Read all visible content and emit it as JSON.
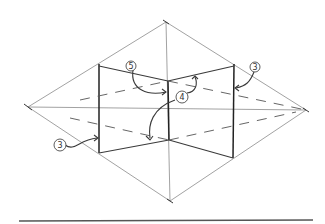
{
  "diagram": {
    "type": "perspective-sketch",
    "colors": {
      "ink": "#333333",
      "background": "#ffffff",
      "rule": "#555555"
    },
    "labels": [
      {
        "id": "label-5",
        "text": "5"
      },
      {
        "id": "label-4",
        "text": "4"
      },
      {
        "id": "label-3-right",
        "text": "3"
      },
      {
        "id": "label-3-left",
        "text": "3"
      }
    ]
  }
}
